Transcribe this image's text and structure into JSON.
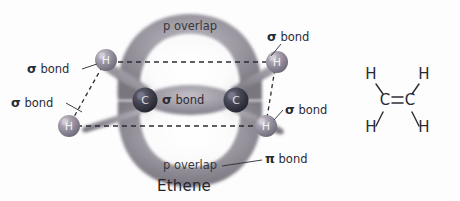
{
  "diagram": {
    "title": "Ethene",
    "molecule_name": "Ethene",
    "background_color": "#fdfdfd",
    "labels": {
      "p_overlap_top": "p overlap",
      "p_overlap_bottom": "p overlap",
      "sigma_bond_center": "bond",
      "sigma_bond_top_left": "bond",
      "sigma_bond_mid_left": "bond",
      "sigma_bond_top_right": "bond",
      "sigma_bond_bottom_right": "bond",
      "pi_bond": "bond",
      "sigma_symbol": "σ",
      "pi_symbol": "π"
    },
    "atoms": {
      "carbon_symbol": "C",
      "hydrogen_symbol": "H",
      "carbon_color": "#3b3b4a",
      "hydrogen_color": "#8b8593",
      "carbon_left_label": "C",
      "carbon_right_label": "C",
      "hydrogen_top_left_label": "H",
      "hydrogen_bottom_left_label": "H",
      "hydrogen_top_right_label": "H",
      "hydrogen_bottom_right_label": "H"
    },
    "orbital_colors": {
      "pi_cloud": "#8d8a93",
      "sp2_lobe": "#9b97a0",
      "sigma_lobe": "#a6a2ab"
    },
    "guide_lines": {
      "style": "dashed",
      "color": "#2b2b33"
    }
  },
  "structural_formula": {
    "type": "lewis-skeletal",
    "name": "ethene-structural-formula",
    "bond_type": "double",
    "carbon_left": "C",
    "carbon_right": "C",
    "hydrogen_top_left": "H",
    "hydrogen_top_right": "H",
    "hydrogen_bottom_left": "H",
    "hydrogen_bottom_right": "H",
    "bond_color": "#2a2a32"
  }
}
